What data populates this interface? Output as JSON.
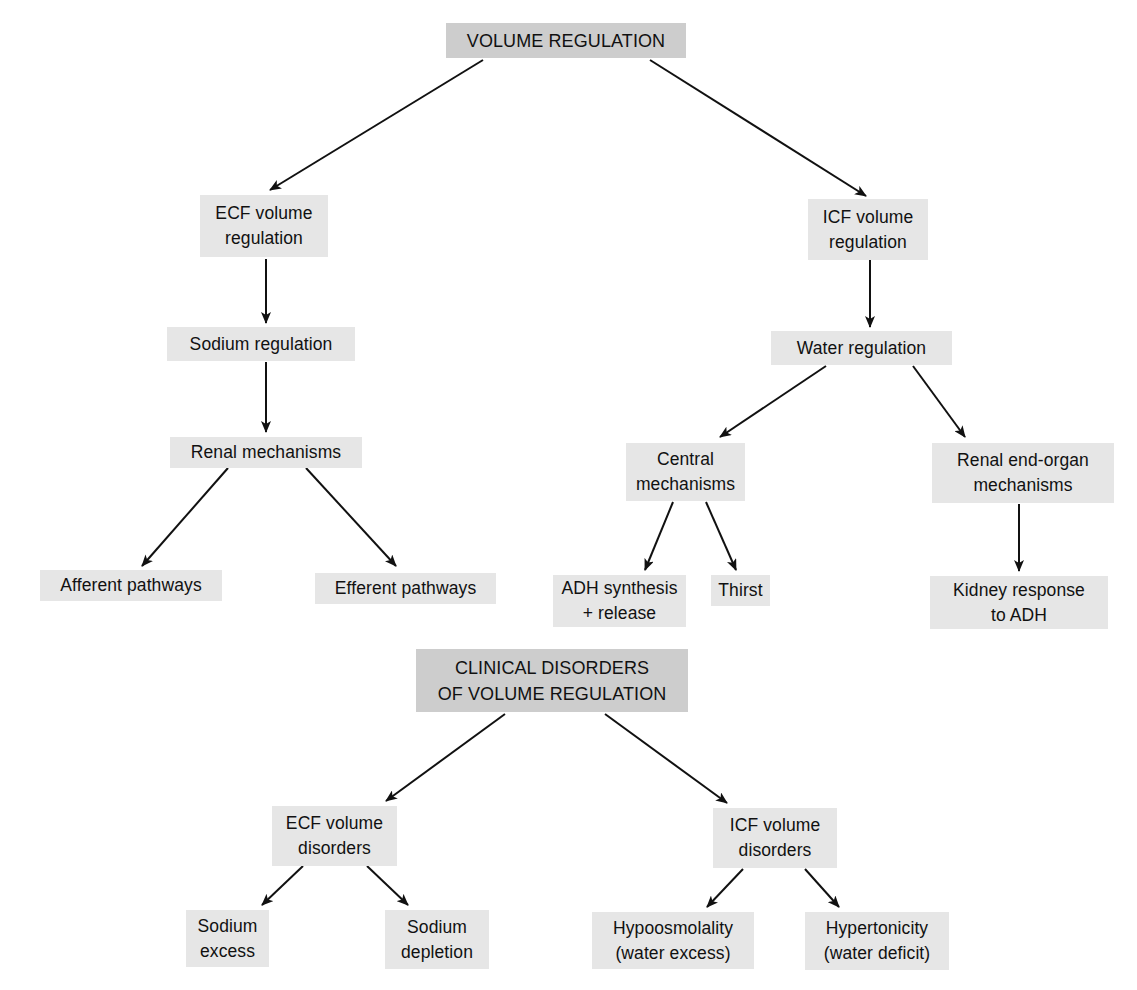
{
  "diagram": {
    "type": "flowchart-tree",
    "colors": {
      "background": "#ffffff",
      "node_fill": "#e6e6e6",
      "heading_fill": "#cdcdcd",
      "text": "#111111",
      "arrow": "#111111"
    },
    "nodes": {
      "volume_regulation": {
        "lines": [
          "VOLUME REGULATION"
        ],
        "box": [
          446,
          23,
          240,
          35
        ]
      },
      "ecf_volume_regulation": {
        "lines": [
          "ECF volume",
          "regulation"
        ],
        "box": [
          200,
          195,
          128,
          62
        ]
      },
      "icf_volume_regulation": {
        "lines": [
          "ICF volume",
          "regulation"
        ],
        "box": [
          808,
          199,
          120,
          61
        ]
      },
      "sodium_regulation": {
        "lines": [
          "Sodium regulation"
        ],
        "box": [
          167,
          327,
          188,
          34
        ]
      },
      "water_regulation": {
        "lines": [
          "Water regulation"
        ],
        "box": [
          771,
          331,
          181,
          34
        ]
      },
      "renal_mechanisms": {
        "lines": [
          "Renal mechanisms"
        ],
        "box": [
          170,
          437,
          192,
          31
        ]
      },
      "central_mechanisms": {
        "lines": [
          "Central",
          "mechanisms"
        ],
        "box": [
          626,
          443,
          119,
          58
        ]
      },
      "renal_end_organ_mechanisms": {
        "lines": [
          "Renal end-organ",
          "mechanisms"
        ],
        "box": [
          932,
          443,
          182,
          60
        ]
      },
      "afferent_pathways": {
        "lines": [
          "Afferent pathways"
        ],
        "box": [
          40,
          570,
          182,
          31
        ]
      },
      "efferent_pathways": {
        "lines": [
          "Efferent pathways"
        ],
        "box": [
          315,
          573,
          181,
          31
        ]
      },
      "adh_synthesis_release": {
        "lines": [
          "ADH synthesis",
          "+ release"
        ],
        "box": [
          553,
          575,
          133,
          52
        ]
      },
      "thirst": {
        "lines": [
          "Thirst"
        ],
        "box": [
          711,
          575,
          59,
          31
        ]
      },
      "kidney_response_to_adh": {
        "lines": [
          "Kidney response",
          "to ADH"
        ],
        "box": [
          930,
          576,
          178,
          53
        ]
      },
      "clinical_disorders": {
        "lines": [
          "CLINICAL DISORDERS",
          "OF VOLUME REGULATION"
        ],
        "box": [
          416,
          649,
          272,
          63
        ]
      },
      "ecf_volume_disorders": {
        "lines": [
          "ECF volume",
          "disorders"
        ],
        "box": [
          272,
          806,
          125,
          60
        ]
      },
      "icf_volume_disorders": {
        "lines": [
          "ICF volume",
          "disorders"
        ],
        "box": [
          713,
          808,
          124,
          60
        ]
      },
      "sodium_excess": {
        "lines": [
          "Sodium",
          "excess"
        ],
        "box": [
          186,
          910,
          83,
          57
        ]
      },
      "sodium_depletion": {
        "lines": [
          "Sodium",
          "depletion"
        ],
        "box": [
          385,
          910,
          104,
          59
        ]
      },
      "hypoosmolality": {
        "lines": [
          "Hypoosmolality",
          "(water excess)"
        ],
        "box": [
          592,
          912,
          162,
          57
        ]
      },
      "hypertonicity": {
        "lines": [
          "Hypertonicity",
          "(water deficit)"
        ],
        "box": [
          805,
          912,
          144,
          58
        ]
      }
    },
    "edges": [
      {
        "from": "volume_regulation",
        "to": "ecf_volume_regulation",
        "line": [
          483,
          60,
          270,
          190
        ]
      },
      {
        "from": "volume_regulation",
        "to": "icf_volume_regulation",
        "line": [
          650,
          60,
          866,
          196
        ]
      },
      {
        "from": "ecf_volume_regulation",
        "to": "sodium_regulation",
        "line": [
          266,
          259,
          266,
          323
        ]
      },
      {
        "from": "sodium_regulation",
        "to": "renal_mechanisms",
        "line": [
          266,
          362,
          266,
          432
        ]
      },
      {
        "from": "renal_mechanisms",
        "to": "afferent_pathways",
        "line": [
          228,
          468,
          142,
          566
        ]
      },
      {
        "from": "renal_mechanisms",
        "to": "efferent_pathways",
        "line": [
          306,
          468,
          396,
          566
        ]
      },
      {
        "from": "icf_volume_regulation",
        "to": "water_regulation",
        "line": [
          870,
          260,
          870,
          327
        ]
      },
      {
        "from": "water_regulation",
        "to": "central_mechanisms",
        "line": [
          826,
          366,
          720,
          437
        ]
      },
      {
        "from": "water_regulation",
        "to": "renal_end_organ_mechanisms",
        "line": [
          913,
          366,
          965,
          437
        ]
      },
      {
        "from": "central_mechanisms",
        "to": "adh_synthesis_release",
        "line": [
          673,
          502,
          645,
          570
        ]
      },
      {
        "from": "central_mechanisms",
        "to": "thirst",
        "line": [
          706,
          502,
          736,
          570
        ]
      },
      {
        "from": "renal_end_organ_mechanisms",
        "to": "kidney_response_to_adh",
        "line": [
          1019,
          504,
          1019,
          571
        ]
      },
      {
        "from": "clinical_disorders",
        "to": "ecf_volume_disorders",
        "line": [
          505,
          714,
          386,
          801
        ]
      },
      {
        "from": "clinical_disorders",
        "to": "icf_volume_disorders",
        "line": [
          605,
          714,
          727,
          803
        ]
      },
      {
        "from": "ecf_volume_disorders",
        "to": "sodium_excess",
        "line": [
          303,
          866,
          262,
          905
        ]
      },
      {
        "from": "ecf_volume_disorders",
        "to": "sodium_depletion",
        "line": [
          367,
          866,
          408,
          905
        ]
      },
      {
        "from": "icf_volume_disorders",
        "to": "hypoosmolality",
        "line": [
          743,
          869,
          707,
          907
        ]
      },
      {
        "from": "icf_volume_disorders",
        "to": "hypertonicity",
        "line": [
          805,
          869,
          839,
          907
        ]
      }
    ]
  }
}
